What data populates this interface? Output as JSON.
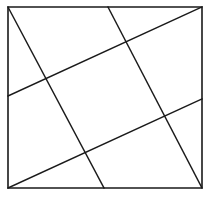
{
  "figure": {
    "canvas": {
      "width": 212,
      "height": 205
    },
    "colors": {
      "background": "#ffffff",
      "stroke": "#1a1a1a",
      "frame_stroke": "#1a1a1a"
    },
    "stroke_widths": {
      "frame": 1.6,
      "chord": 1.4
    },
    "frame": {
      "name": "outer-square",
      "left": 8,
      "top": 7,
      "right": 202,
      "bottom": 188,
      "width": 194,
      "height": 181,
      "points": "8,7 202,7 202,188 8,188 8,7"
    },
    "chords": [
      {
        "name": "chord-shallow-upper",
        "label": "A",
        "orientation": "shallow",
        "x1": 8,
        "y1": 96,
        "x2": 202,
        "y2": 7,
        "start_anchor": "left-edge",
        "end_anchor": "top-right-corner"
      },
      {
        "name": "chord-shallow-lower",
        "label": "B",
        "orientation": "shallow",
        "x1": 8,
        "y1": 188,
        "x2": 202,
        "y2": 99,
        "start_anchor": "bottom-left-corner",
        "end_anchor": "right-edge"
      },
      {
        "name": "chord-steep-left",
        "label": "C",
        "orientation": "steep",
        "x1": 8,
        "y1": 7,
        "x2": 104,
        "y2": 188,
        "start_anchor": "top-left-corner",
        "end_anchor": "bottom-edge"
      },
      {
        "name": "chord-steep-right",
        "label": "D",
        "orientation": "steep",
        "x1": 108,
        "y1": 7,
        "x2": 202,
        "y2": 188,
        "start_anchor": "top-edge",
        "end_anchor": "bottom-right-corner"
      }
    ],
    "intersections": [
      {
        "name": "vertex-top",
        "x": 125,
        "y": 48,
        "chords": [
          "A",
          "D"
        ]
      },
      {
        "name": "vertex-left",
        "x": 50,
        "y": 85,
        "chords": [
          "A",
          "C"
        ]
      },
      {
        "name": "vertex-bottom",
        "x": 88,
        "y": 155,
        "chords": [
          "B",
          "C"
        ]
      },
      {
        "name": "vertex-right",
        "x": 165,
        "y": 115,
        "chords": [
          "B",
          "D"
        ]
      }
    ],
    "inner_square": {
      "name": "inner-tilted-square",
      "points": "125,48 165,115 88,155 50,85 125,48"
    }
  }
}
